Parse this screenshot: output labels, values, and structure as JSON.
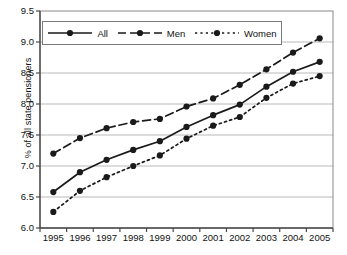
{
  "chart_data": {
    "type": "line",
    "title": "",
    "xlabel": "",
    "ylabel": "% of all state pensioners",
    "categories": [
      "1995",
      "1996",
      "1997",
      "1998",
      "1999",
      "2000",
      "2001",
      "2002",
      "2003",
      "2004",
      "2005"
    ],
    "x": [
      1995,
      1996,
      1997,
      1998,
      1999,
      2000,
      2001,
      2002,
      2003,
      2004,
      2005
    ],
    "ylim": [
      6.0,
      9.5
    ],
    "ytick_labels": [
      "9.5",
      "9.0",
      "8.5",
      "8.0",
      "7.5",
      "7.0",
      "6.5",
      "6.0"
    ],
    "yticks": [
      9.5,
      9.0,
      8.5,
      8.0,
      7.5,
      7.0,
      6.5,
      6.0
    ],
    "grid": true,
    "legend_position": "top-left-inside",
    "series": [
      {
        "name": "All",
        "line_style": "solid",
        "marker": "filled-circle",
        "color": "#1a1a1a",
        "values": [
          6.58,
          6.9,
          7.1,
          7.26,
          7.4,
          7.63,
          7.82,
          7.99,
          8.28,
          8.52,
          8.68
        ]
      },
      {
        "name": "Men",
        "line_style": "dashed",
        "marker": "filled-circle",
        "color": "#1a1a1a",
        "values": [
          7.2,
          7.45,
          7.61,
          7.71,
          7.76,
          7.96,
          8.09,
          8.31,
          8.56,
          8.83,
          9.06
        ]
      },
      {
        "name": "Women",
        "line_style": "dotted",
        "marker": "filled-circle",
        "color": "#1a1a1a",
        "values": [
          6.26,
          6.6,
          6.82,
          7.0,
          7.17,
          7.44,
          7.65,
          7.79,
          8.1,
          8.33,
          8.45
        ]
      }
    ]
  },
  "legend": {
    "items": [
      {
        "label": "All"
      },
      {
        "label": "Men"
      },
      {
        "label": "Women"
      }
    ]
  },
  "colors": {
    "ink": "#1a1a1a",
    "grid": "#b9b9b9",
    "axis": "#555555",
    "background": "#ffffff"
  }
}
